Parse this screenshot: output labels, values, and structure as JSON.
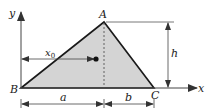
{
  "diagram": {
    "type": "triangle-centroid-figure",
    "colors": {
      "fill": "#d4d4d4",
      "stroke": "#1a1a1a",
      "line": "#444444"
    },
    "axes": {
      "x_label": "x",
      "y_label": "y"
    },
    "vertices": {
      "A": "A",
      "B": "B",
      "C": "C"
    },
    "dimensions": {
      "a": "a",
      "b": "b",
      "h": "h",
      "x0_main": "x",
      "x0_sub": "0"
    }
  }
}
